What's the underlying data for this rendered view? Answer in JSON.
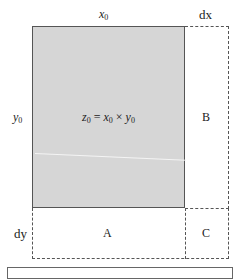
{
  "diagram": {
    "labels": {
      "top_width": {
        "var": "x",
        "sub": "0"
      },
      "top_increment": "dx",
      "left_height": {
        "var": "y",
        "sub": "0"
      },
      "left_increment": "dy",
      "center_formula": {
        "lhs_var": "z",
        "lhs_sub": "0",
        "eq": "=",
        "x_var": "x",
        "x_sub": "0",
        "times": "×",
        "y_var": "y",
        "y_sub": "0"
      },
      "region_right": "B",
      "region_bottom": "A",
      "region_corner": "C"
    },
    "colors": {
      "main_rect_fill": "#d6d6d6",
      "stroke": "#555555"
    }
  }
}
